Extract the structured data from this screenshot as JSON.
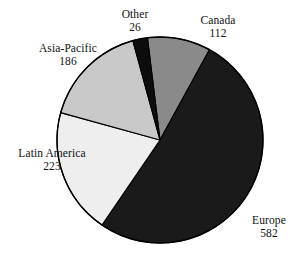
{
  "chart_data": {
    "type": "pie",
    "title": "",
    "subtitle": "",
    "xlabel": "",
    "ylabel": "",
    "legend_position": "none",
    "grid": false,
    "total": 1129,
    "start_angle_deg": 353,
    "direction": "clockwise",
    "categories": [
      "Canada",
      "Europe",
      "Latin America",
      "Asia-Pacific",
      "Other"
    ],
    "values": [
      112,
      582,
      223,
      186,
      26
    ],
    "slices": [
      {
        "label": "Canada",
        "value": 112,
        "value_text": "112",
        "color": "#8a8a8a",
        "angle_deg": 35.7,
        "start_deg": 353.0,
        "end_deg": 28.7
      },
      {
        "label": "Europe",
        "value": 582,
        "value_text": "582",
        "color": "#1a1a1a",
        "angle_deg": 185.6,
        "start_deg": 28.7,
        "end_deg": 214.3
      },
      {
        "label": "Latin America",
        "value": 223,
        "value_text": "223",
        "color": "#eeeeee",
        "angle_deg": 71.1,
        "start_deg": 214.3,
        "end_deg": 285.4
      },
      {
        "label": "Asia-Pacific",
        "value": 186,
        "value_text": "186",
        "color": "#c9c9c9",
        "angle_deg": 59.3,
        "start_deg": 285.4,
        "end_deg": 344.7
      },
      {
        "label": "Other",
        "value": 26,
        "value_text": "26",
        "color": "#0d0d0d",
        "angle_deg": 8.3,
        "start_deg": 344.7,
        "end_deg": 353.0
      }
    ],
    "geometry": {
      "center_x": 160,
      "center_y": 140,
      "radius": 103
    },
    "colors": {
      "outline": "#000000",
      "background": "#ffffff",
      "text": "#111111"
    }
  }
}
